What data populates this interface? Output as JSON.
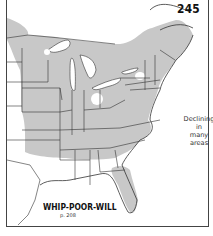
{
  "map": {
    "number": "245",
    "species": "WHIP-POOR-WILL",
    "page_ref": "p. 208",
    "note_lines": [
      "Declining",
      "in",
      "many",
      "areas"
    ],
    "region": "Eastern North America",
    "colors": {
      "range_fill": "#c8c8c8",
      "background": "#ffffff",
      "border_lines": "#333333"
    },
    "legend": {
      "range": "Breeding range (shaded gray)"
    }
  }
}
